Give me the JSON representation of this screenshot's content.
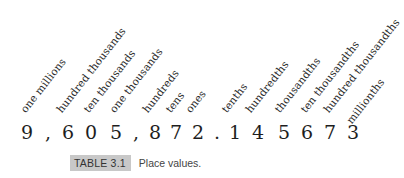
{
  "figure": {
    "place_labels": [
      {
        "label": "one millions",
        "x": 27,
        "y": 104
      },
      {
        "label": "hundred thousands",
        "x": 63,
        "y": 104
      },
      {
        "label": "ten thousands",
        "x": 90,
        "y": 104
      },
      {
        "label": "one thousands",
        "x": 116,
        "y": 104
      },
      {
        "label": "hundreds",
        "x": 149,
        "y": 104
      },
      {
        "label": "tens",
        "x": 172,
        "y": 104
      },
      {
        "label": "ones",
        "x": 192,
        "y": 104
      },
      {
        "label": "tenths",
        "x": 228,
        "y": 104
      },
      {
        "label": "hundredths",
        "x": 252,
        "y": 104
      },
      {
        "label": "thousandths",
        "x": 281,
        "y": 104
      },
      {
        "label": "ten thousandths",
        "x": 307,
        "y": 104
      },
      {
        "label": "hundred thousandths",
        "x": 330,
        "y": 104
      },
      {
        "label": "millionths",
        "x": 353,
        "y": 115
      }
    ],
    "number_glyphs": [
      {
        "char": "9",
        "x": 27,
        "type": "digit"
      },
      {
        "char": ",",
        "x": 48,
        "type": "separator"
      },
      {
        "char": "6",
        "x": 68,
        "type": "digit"
      },
      {
        "char": "0",
        "x": 91,
        "type": "digit"
      },
      {
        "char": "5",
        "x": 116,
        "type": "digit"
      },
      {
        "char": ",",
        "x": 136,
        "type": "separator"
      },
      {
        "char": "8",
        "x": 155,
        "type": "digit"
      },
      {
        "char": "7",
        "x": 176,
        "type": "digit"
      },
      {
        "char": "2",
        "x": 198,
        "type": "digit"
      },
      {
        "char": ".",
        "x": 217,
        "type": "separator"
      },
      {
        "char": "1",
        "x": 235,
        "type": "digit"
      },
      {
        "char": "4",
        "x": 258,
        "type": "digit"
      },
      {
        "char": "5",
        "x": 284,
        "type": "digit"
      },
      {
        "char": "6",
        "x": 307,
        "type": "digit"
      },
      {
        "char": "7",
        "x": 330,
        "type": "digit"
      },
      {
        "char": "3",
        "x": 353,
        "type": "digit"
      }
    ],
    "number_text": "9,605,872.145673"
  },
  "caption": {
    "tag": "TABLE 3.1",
    "text": "Place values."
  }
}
